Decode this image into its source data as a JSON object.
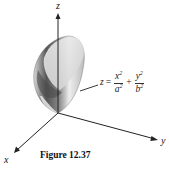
{
  "figure": {
    "caption": "Figure 12.37",
    "axes": {
      "x": "x",
      "y": "y",
      "z": "z"
    },
    "equation": {
      "lhs": "z",
      "equals": "=",
      "term1": {
        "numerator": "x",
        "num_exp": "2",
        "denominator": "a",
        "den_exp": "2"
      },
      "plus": "+",
      "term2": {
        "numerator": "y",
        "num_exp": "2",
        "denominator": "b",
        "den_exp": "2"
      }
    },
    "surface": "elliptic-paraboloid"
  }
}
